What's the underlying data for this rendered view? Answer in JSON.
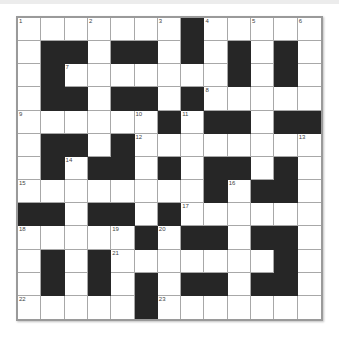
{
  "puzzle": {
    "rows": 13,
    "cols": 13,
    "layout": [
      "WWWWWWWBWWWWW",
      "WBBWBBWBWBWBW",
      "WBWWWWWWWBWBW",
      "WBBWBBWBWWWWW",
      "WWWWWWBWBBWBB",
      "WBBWBWWWWWWWW",
      "WBWBBWBWBBWBW",
      "WWWWWWWWBWBBW",
      "BBWBBWBWWWWWW",
      "WWWWWBWBBWBBW",
      "WBWBWWWWWWWBW",
      "WBWBWBWBBWBBW",
      "WWWWWBWWWWWWW"
    ],
    "numbers": [
      {
        "r": 0,
        "c": 0,
        "n": "1"
      },
      {
        "r": 0,
        "c": 3,
        "n": "2"
      },
      {
        "r": 0,
        "c": 6,
        "n": "3"
      },
      {
        "r": 0,
        "c": 8,
        "n": "4"
      },
      {
        "r": 0,
        "c": 10,
        "n": "5"
      },
      {
        "r": 0,
        "c": 12,
        "n": "6"
      },
      {
        "r": 2,
        "c": 2,
        "n": "7"
      },
      {
        "r": 3,
        "c": 8,
        "n": "8"
      },
      {
        "r": 4,
        "c": 0,
        "n": "9"
      },
      {
        "r": 4,
        "c": 5,
        "n": "10"
      },
      {
        "r": 4,
        "c": 7,
        "n": "11"
      },
      {
        "r": 5,
        "c": 5,
        "n": "12"
      },
      {
        "r": 5,
        "c": 12,
        "n": "13"
      },
      {
        "r": 6,
        "c": 2,
        "n": "14"
      },
      {
        "r": 7,
        "c": 0,
        "n": "15"
      },
      {
        "r": 7,
        "c": 9,
        "n": "16"
      },
      {
        "r": 8,
        "c": 7,
        "n": "17"
      },
      {
        "r": 9,
        "c": 0,
        "n": "18"
      },
      {
        "r": 9,
        "c": 4,
        "n": "19"
      },
      {
        "r": 9,
        "c": 6,
        "n": "20"
      },
      {
        "r": 10,
        "c": 4,
        "n": "21"
      },
      {
        "r": 12,
        "c": 0,
        "n": "22"
      },
      {
        "r": 12,
        "c": 6,
        "n": "23"
      }
    ],
    "colors": {
      "black_cell": "#262626",
      "white_cell": "#ffffff",
      "grid_line": "#a8a8a8",
      "frame": "#9a9a9a"
    }
  }
}
